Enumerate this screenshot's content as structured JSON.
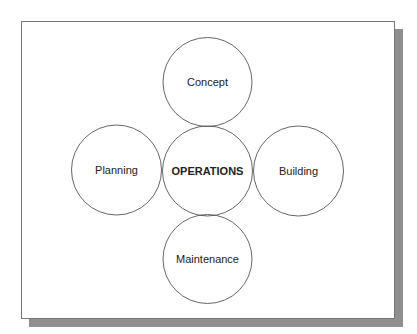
{
  "diagram": {
    "center": {
      "label": "OPERATIONS",
      "cx": 207.5,
      "cy": 171,
      "r": 45
    },
    "nodes": [
      {
        "label": "Concept",
        "cx": 207.5,
        "cy": 82,
        "r": 44.5
      },
      {
        "label": "Planning",
        "cx": 116.5,
        "cy": 170,
        "r": 45
      },
      {
        "label": "Building",
        "cx": 298.5,
        "cy": 171,
        "r": 45
      },
      {
        "label": "Maintenance",
        "cx": 207.5,
        "cy": 259,
        "r": 44.5
      }
    ],
    "colors": {
      "stroke": "#555555",
      "shadow": "#8f8f8f",
      "frame_border": "#777777",
      "text": "#222222"
    }
  }
}
